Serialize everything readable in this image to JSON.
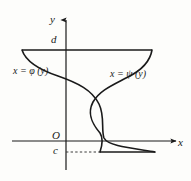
{
  "figure": {
    "background_color": "#fdfdfb",
    "stroke_color": "#1a1a1a",
    "axes": {
      "x_axis_label": "x",
      "y_axis_label": "y",
      "origin_label": "O",
      "x_axis_y_px": 141,
      "y_axis_x_px": 66,
      "x_axis_from_px": 12,
      "x_axis_to_px": 178,
      "y_axis_from_px": 170,
      "y_axis_to_px": 18
    },
    "bounds": {
      "upper_label": "d",
      "lower_label": "c",
      "upper_y_px": 50,
      "lower_y_px": 152
    },
    "curves": [
      {
        "id": "phi",
        "label_prefix": "x",
        "label_equals": "=",
        "label_symbol": "φ",
        "label_arg": "(y)",
        "label_full": "x = φ (y)"
      },
      {
        "id": "psi",
        "label_prefix": "x",
        "label_equals": "=",
        "label_symbol": "ψ",
        "label_arg": "(y)",
        "label_full": "x = ψ (y)"
      }
    ],
    "segments": {
      "top_chord": {
        "x1": 22,
        "y1": 50,
        "x2": 152,
        "y2": 50
      },
      "bottom_chord": {
        "x1": 100,
        "y1": 152,
        "x2": 155,
        "y2": 152
      },
      "dashed_guide": {
        "x1": 66,
        "y1": 152,
        "x2": 100,
        "y2": 152
      }
    }
  }
}
